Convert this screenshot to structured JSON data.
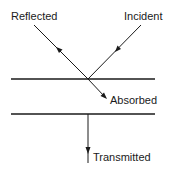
{
  "diagram": {
    "type": "light-interaction-with-medium",
    "labels": {
      "reflected": "Reflected",
      "incident": "Incident",
      "absorbed": "Absorbed",
      "transmitted": "Transmitted"
    },
    "elements": [
      {
        "name": "top-surface",
        "kind": "line",
        "from": [
          11,
          79
        ],
        "to": [
          155,
          79
        ]
      },
      {
        "name": "bottom-surface",
        "kind": "line",
        "from": [
          11,
          114
        ],
        "to": [
          155,
          114
        ]
      },
      {
        "name": "incident-ray",
        "kind": "arrow-line",
        "from": [
          141,
          25
        ],
        "to": [
          88,
          79
        ],
        "arrow_direction": "toward-surface"
      },
      {
        "name": "reflected-ray",
        "kind": "arrow-line",
        "from": [
          88,
          79
        ],
        "to": [
          34,
          25
        ],
        "arrow_direction": "away-from-surface"
      },
      {
        "name": "absorbed-ray",
        "kind": "arrow-line",
        "from": [
          88,
          79
        ],
        "to": [
          106,
          98
        ],
        "arrow_direction": "into-medium"
      },
      {
        "name": "transmitted-ray",
        "kind": "arrow-line",
        "from": [
          88,
          114
        ],
        "to": [
          88,
          163
        ],
        "arrow_direction": "down"
      }
    ],
    "colors": {
      "line": "#1a1a1a",
      "background": "#ffffff"
    }
  }
}
